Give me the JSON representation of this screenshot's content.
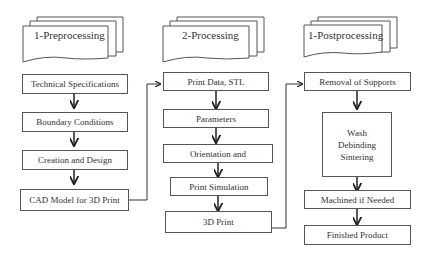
{
  "columns": [
    {
      "header": "1-Preprocessing",
      "steps": [
        "Technical Specifications",
        "Boundary Conditions",
        "Creation and Design",
        "CAD Model for 3D Print"
      ]
    },
    {
      "header": "2-Processing",
      "steps": [
        "Print Data, STL",
        "Parameters",
        "Orientation and",
        "Print Simulation",
        "3D Print"
      ]
    },
    {
      "header": "1-Postprocessing",
      "steps": [
        "Removal of Supports",
        "Wash\nDebinding\nSintering",
        "Machined if Needed",
        "Finished Product"
      ]
    }
  ],
  "colors": {
    "stroke": "#555555",
    "arrow": "#222222"
  }
}
